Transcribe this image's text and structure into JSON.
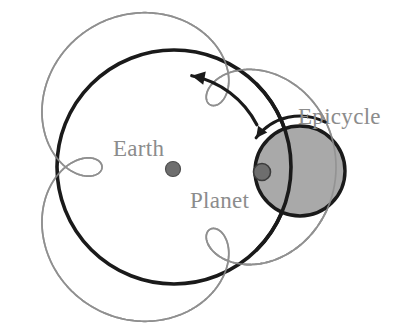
{
  "figure": {
    "type": "diagram",
    "width": 408,
    "height": 327,
    "background": "#ffffff"
  },
  "labels": {
    "earth": "Earth",
    "planet": "Planet",
    "epicycle": "Epicycle"
  },
  "colors": {
    "deferent_stroke": "#1a1a1a",
    "epitrochoid_stroke": "#8f8f8f",
    "epitrochoid_dashed_stroke": "#9a9a9a",
    "epicycle_fill": "#a9a9a9",
    "epicycle_stroke": "#1a1a1a",
    "earth_dot_fill": "#6e6e6e",
    "earth_dot_stroke": "#4d4d4d",
    "planet_dot_fill": "#6e6e6e",
    "planet_dot_stroke": "#3c3c3c",
    "arrow_stroke": "#1a1a1a",
    "label_text": "#8c8c8c"
  },
  "geometry": {
    "deferent": {
      "cx": 174,
      "cy": 167,
      "r": 117,
      "stroke_width": 3.6
    },
    "epicycle": {
      "cx": 300,
      "cy": 171,
      "r": 45,
      "stroke_width": 3.4
    },
    "earth_dot": {
      "cx": 173,
      "cy": 169,
      "r": 7.5
    },
    "planet_dot": {
      "cx": 262,
      "cy": 172,
      "r": 8.5
    },
    "epitrochoid": {
      "R": 117,
      "r": 45,
      "d": 45,
      "loops": 3,
      "t_start": 0.0,
      "t_end": 6.283185307179586,
      "samples": 900,
      "phase": 0.0,
      "stroke_width": 1.7
    },
    "epitrochoid_dashed": {
      "t_start": 6.283185307179586,
      "t_end": 7.15,
      "samples": 140,
      "dash": "6 5",
      "stroke_width": 1.9
    },
    "deferent_arrow": {
      "arc_cx": 174,
      "arc_cy": 167,
      "arc_r": 93,
      "start_deg": -27,
      "end_deg": -79,
      "head_deg": -79,
      "head_size": 13,
      "stroke_width": 3.2
    },
    "epicycle_arrow": {
      "arc_cx": 300,
      "arc_cy": 171,
      "arc_r": 55,
      "start_deg": -62,
      "end_deg": -143,
      "head_deg": -143,
      "head_size": 11,
      "stroke_width": 3.0
    }
  },
  "label_positions": {
    "earth": {
      "x": 113,
      "y": 156,
      "anchor": "start"
    },
    "planet": {
      "x": 190,
      "y": 208,
      "anchor": "start"
    },
    "epicycle": {
      "x": 298,
      "y": 124,
      "anchor": "start"
    }
  }
}
